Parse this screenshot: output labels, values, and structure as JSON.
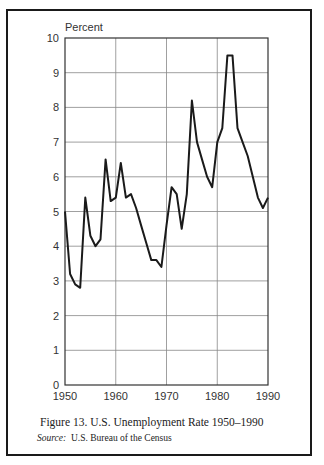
{
  "chart_data": {
    "type": "line",
    "title": "Figure 13. U.S. Unemployment Rate 1950–1990",
    "source_label": "Source:",
    "source_text": "U.S. Bureau of the Census",
    "xlabel": "",
    "ylabel": "Percent",
    "xlim": [
      1950,
      1990
    ],
    "ylim": [
      0,
      10
    ],
    "grid": true,
    "legend": null,
    "x_ticks": [
      "1950",
      "1960",
      "1970",
      "1980",
      "1990"
    ],
    "y_ticks": [
      "0",
      "1",
      "2",
      "3",
      "4",
      "5",
      "6",
      "7",
      "8",
      "9",
      "10"
    ],
    "series": [
      {
        "name": "Unemployment Rate",
        "color": "#1a1a1a",
        "x": [
          1950,
          1951,
          1952,
          1953,
          1954,
          1955,
          1956,
          1957,
          1958,
          1959,
          1960,
          1961,
          1962,
          1963,
          1964,
          1965,
          1966,
          1967,
          1968,
          1969,
          1970,
          1971,
          1972,
          1973,
          1974,
          1975,
          1976,
          1977,
          1978,
          1979,
          1980,
          1981,
          1982,
          1983,
          1984,
          1985,
          1986,
          1987,
          1988,
          1989,
          1990
        ],
        "values": [
          5.0,
          3.2,
          2.9,
          2.8,
          5.4,
          4.3,
          4.0,
          4.2,
          6.5,
          5.3,
          5.4,
          6.4,
          5.4,
          5.5,
          5.1,
          4.6,
          4.1,
          3.6,
          3.6,
          3.4,
          4.6,
          5.7,
          5.5,
          4.5,
          5.5,
          8.2,
          7.0,
          6.5,
          6.0,
          5.7,
          7.0,
          7.4,
          9.5,
          9.5,
          7.4,
          7.0,
          6.6,
          6.0,
          5.4,
          5.1,
          5.4
        ]
      }
    ]
  },
  "figure": {
    "caption": "Figure 13. U.S. Unemployment Rate 1950–1990",
    "source_label": "Source:",
    "source_text": "U.S. Bureau of the Census",
    "y_axis_label": "Percent"
  }
}
